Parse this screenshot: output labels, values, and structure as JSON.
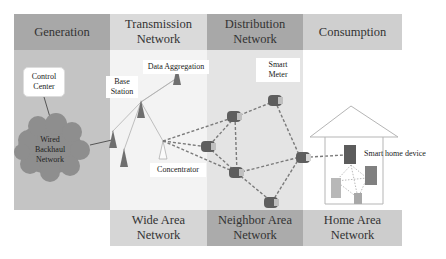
{
  "diagram": {
    "columns": [
      {
        "id": "generation",
        "header": "Generation"
      },
      {
        "id": "transmission",
        "header": "Transmission Network",
        "header_lines": [
          "Transmission",
          "Network"
        ]
      },
      {
        "id": "distribution",
        "header": "Distribution Network",
        "header_lines": [
          "Distribution",
          "Network"
        ]
      },
      {
        "id": "consumption",
        "header": "Consumption"
      }
    ],
    "bottom_labels": [
      {
        "id": "wan",
        "lines": [
          "Wide Area",
          "Network"
        ]
      },
      {
        "id": "nan",
        "lines": [
          "Neighbor Area",
          "Network"
        ]
      },
      {
        "id": "han",
        "lines": [
          "Home Area",
          "Network"
        ]
      }
    ],
    "nodes": {
      "control_center": {
        "lines": [
          "Control",
          "Center"
        ]
      },
      "wired_backhaul": {
        "lines": [
          "Wired",
          "Backhaul",
          "Network"
        ]
      },
      "base_station": {
        "lines": [
          "Base",
          "Station"
        ]
      },
      "data_aggregation": {
        "label": "Data Aggregation"
      },
      "concentrator": {
        "label": "Concentrator"
      },
      "smart_meter": {
        "lines": [
          "Smart",
          "Meter"
        ]
      },
      "smart_home_device": {
        "label": "Smart home device"
      }
    },
    "colors": {
      "header_dark": "#a9a9a9",
      "header_light": "#d4d4d4",
      "generation_bg": "#c4c4c4",
      "transmission_bg": "#f2f2f2",
      "distribution_bg": "#e3e3e3",
      "cloud": "#8c8c8c",
      "tower": "#6e6e6e",
      "meter": "#5f5f5f",
      "link_dashed": "#7a7a7a"
    }
  }
}
